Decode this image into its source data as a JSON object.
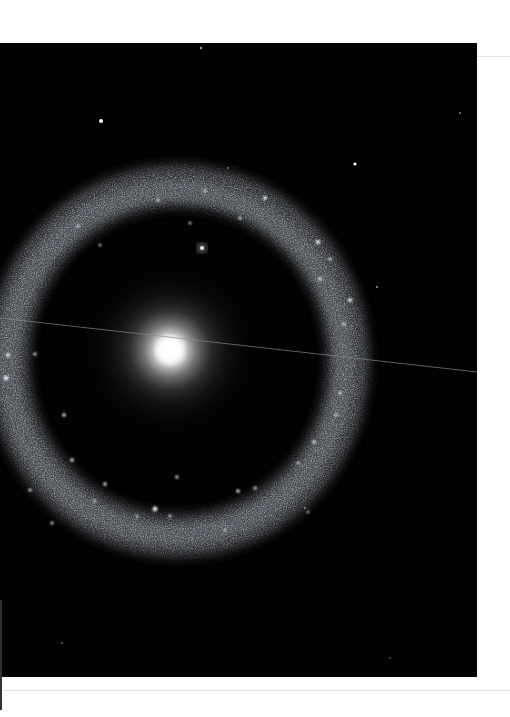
{
  "image": {
    "subject": "ring galaxy with bright central core",
    "alt": "Ring galaxy photograph: glowing yellow-white nucleus surrounded by a detached ring of blue-white star clusters on a black background",
    "background_color": "#020202",
    "core": {
      "cx": 170,
      "cy": 307,
      "color": "#ffffff"
    },
    "ring": {
      "cx": 178,
      "cy": 318,
      "rx": 170,
      "ry": 175,
      "color": "#9aa0a8"
    },
    "satellite_knot": {
      "cx": 202,
      "cy": 205
    },
    "stars": [
      {
        "cx": 101,
        "cy": 78,
        "r": 2
      },
      {
        "cx": 355,
        "cy": 121,
        "r": 1.6
      },
      {
        "cx": 201,
        "cy": 5,
        "r": 1.2
      },
      {
        "cx": 460,
        "cy": 70,
        "r": 1
      }
    ],
    "streak": {
      "x1": 0,
      "y1": 275,
      "x2": 477,
      "y2": 329
    }
  }
}
